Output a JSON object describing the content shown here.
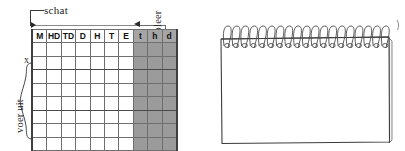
{
  "diagram": {
    "labels": {
      "estimate": "schat",
      "execute": "voer uit",
      "check": "controleer",
      "unknown_marker": "x"
    },
    "table": {
      "headers": [
        "M",
        "HD",
        "TD",
        "D",
        "H",
        "T",
        "E",
        "t",
        "h",
        "d"
      ],
      "shaded_headers": [
        "t",
        "h",
        "d"
      ],
      "body_row_count": 8,
      "column_count": 10,
      "cells": [
        [
          "",
          "",
          "",
          "",
          "",
          "",
          "",
          "",
          "",
          ""
        ],
        [
          "",
          "",
          "",
          "",
          "",
          "",
          "",
          "",
          "",
          ""
        ],
        [
          "",
          "",
          "",
          "",
          "",
          "",
          "",
          "",
          "",
          ""
        ],
        [
          "",
          "",
          "",
          "",
          "",
          "",
          "",
          "",
          "",
          ""
        ],
        [
          "",
          "",
          "",
          "",
          "",
          "",
          "",
          "",
          "",
          ""
        ],
        [
          "",
          "",
          "",
          "",
          "",
          "",
          "",
          "",
          "",
          ""
        ],
        [
          "",
          "",
          "",
          "",
          "",
          "",
          "",
          "",
          "",
          ""
        ],
        [
          "",
          "",
          "",
          "",
          "",
          "",
          "",
          "",
          "",
          ""
        ]
      ]
    },
    "colors": {
      "shading": "#9b9b9b",
      "grid_line": "#6f6f6f",
      "arrow": "#2a2a2a",
      "text": "#1b1b1b"
    }
  },
  "notepad": {
    "caption": "",
    "ring_count": 19,
    "page_content": "",
    "colors": {
      "outline": "#3d3d3d",
      "ring": "#4a4a4a",
      "page": "#ffffff"
    }
  }
}
